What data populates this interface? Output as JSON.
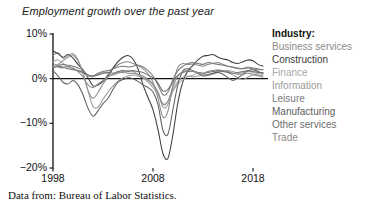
{
  "chart_data": {
    "type": "line",
    "title": "Employment growth over the past year",
    "xlabel": "",
    "ylabel": "",
    "xlim": [
      1998,
      2019.3
    ],
    "ylim": [
      -20,
      10
    ],
    "grid": false,
    "legend_position": "right",
    "legend_title": "Industry:",
    "x_ticks": [
      "1998",
      "2008",
      "2018"
    ],
    "x_tick_values": [
      1998,
      2008,
      2018
    ],
    "y_ticks": [
      "10%",
      "0%",
      "−10%",
      "−20%"
    ],
    "y_tick_values": [
      10,
      0,
      -10,
      -20
    ],
    "zero_line": 0,
    "x": [
      1998.0,
      1998.5,
      1999.0,
      1999.5,
      2000.0,
      2000.5,
      2001.0,
      2001.5,
      2002.0,
      2002.5,
      2003.0,
      2003.5,
      2004.0,
      2004.5,
      2005.0,
      2005.5,
      2006.0,
      2006.5,
      2007.0,
      2007.5,
      2008.0,
      2008.5,
      2009.0,
      2009.5,
      2010.0,
      2010.5,
      2011.0,
      2011.5,
      2012.0,
      2012.5,
      2013.0,
      2013.5,
      2014.0,
      2014.5,
      2015.0,
      2015.5,
      2016.0,
      2016.5,
      2017.0,
      2017.5,
      2018.0,
      2018.5,
      2019.0
    ],
    "series": [
      {
        "name": "Business services",
        "color": "#8c8c8c",
        "values": [
          5.2,
          5.8,
          4.6,
          5.1,
          5.6,
          4.2,
          1.2,
          -2.6,
          -4.4,
          -3.1,
          -1.2,
          0.4,
          2.2,
          3.1,
          3.6,
          3.8,
          3.4,
          3.0,
          2.2,
          1.1,
          -0.8,
          -4.4,
          -8.6,
          -7.2,
          -1.2,
          2.6,
          3.4,
          3.2,
          3.3,
          3.0,
          2.8,
          3.2,
          3.4,
          3.6,
          3.2,
          2.8,
          2.5,
          2.2,
          2.3,
          2.6,
          2.4,
          2.2,
          2.0
        ]
      },
      {
        "name": "Construction",
        "color": "#3c3c3c",
        "values": [
          6.2,
          5.6,
          4.8,
          5.4,
          4.6,
          3.2,
          2.0,
          0.2,
          -1.6,
          -1.4,
          -0.6,
          0.8,
          2.4,
          3.8,
          4.8,
          5.2,
          4.4,
          2.2,
          -1.4,
          -4.2,
          -7.0,
          -11.4,
          -16.8,
          -17.8,
          -12.4,
          -5.2,
          -0.6,
          1.8,
          3.0,
          4.2,
          5.0,
          5.2,
          5.4,
          4.8,
          4.4,
          4.2,
          3.6,
          3.4,
          3.8,
          4.2,
          4.0,
          3.2,
          2.8
        ]
      },
      {
        "name": "Finance",
        "color": "#a8a8a8",
        "values": [
          3.8,
          4.2,
          3.4,
          2.6,
          2.2,
          1.8,
          1.2,
          0.6,
          0.4,
          1.0,
          1.4,
          1.2,
          0.8,
          1.2,
          1.6,
          1.8,
          1.6,
          1.0,
          0.2,
          -0.8,
          -2.0,
          -3.6,
          -5.6,
          -5.2,
          -2.8,
          -1.2,
          -0.2,
          0.4,
          0.8,
          1.2,
          1.0,
          0.8,
          1.0,
          1.4,
          1.6,
          1.8,
          1.6,
          1.2,
          1.4,
          1.6,
          1.4,
          1.2,
          1.2
        ]
      },
      {
        "name": "Information",
        "color": "#9a9a9a",
        "values": [
          2.6,
          3.2,
          4.0,
          4.8,
          5.2,
          4.0,
          1.4,
          -2.8,
          -6.2,
          -6.4,
          -4.6,
          -3.0,
          -1.6,
          -0.6,
          0.2,
          0.6,
          0.8,
          0.6,
          0.2,
          -0.4,
          -1.4,
          -3.2,
          -6.4,
          -5.8,
          -2.6,
          -0.6,
          0.4,
          0.6,
          0.4,
          0.6,
          0.8,
          1.0,
          1.2,
          1.6,
          1.8,
          1.4,
          0.8,
          0.2,
          -0.2,
          0.4,
          0.8,
          0.6,
          0.4
        ]
      },
      {
        "name": "Leisure",
        "color": "#7a7a7a",
        "values": [
          3.4,
          3.0,
          3.2,
          3.0,
          2.8,
          2.4,
          1.8,
          0.8,
          0.6,
          1.2,
          1.6,
          1.8,
          2.2,
          2.6,
          2.8,
          2.6,
          2.8,
          3.0,
          2.6,
          1.8,
          0.6,
          -1.4,
          -3.6,
          -3.0,
          -0.2,
          1.8,
          2.8,
          3.4,
          3.6,
          3.4,
          3.2,
          3.6,
          3.4,
          3.2,
          3.0,
          2.8,
          2.6,
          2.4,
          2.2,
          2.4,
          2.2,
          2.0,
          2.0
        ]
      },
      {
        "name": "Manufacturing",
        "color": "#606060",
        "values": [
          1.8,
          0.6,
          -0.8,
          -1.2,
          -0.4,
          -1.4,
          -3.6,
          -6.6,
          -8.4,
          -7.2,
          -5.6,
          -4.4,
          -2.4,
          -0.8,
          -0.2,
          0.2,
          0.0,
          -0.6,
          -1.4,
          -2.0,
          -3.0,
          -5.8,
          -11.6,
          -12.4,
          -6.8,
          -1.2,
          1.8,
          2.2,
          1.8,
          1.2,
          0.6,
          0.8,
          1.2,
          1.4,
          1.0,
          0.2,
          -0.4,
          0.2,
          1.0,
          1.8,
          2.0,
          1.6,
          1.2
        ]
      },
      {
        "name": "Other services",
        "color": "#6e6e6e",
        "values": [
          2.4,
          2.8,
          2.6,
          2.2,
          2.0,
          1.8,
          1.4,
          0.8,
          0.6,
          0.8,
          1.2,
          1.4,
          1.2,
          1.6,
          1.8,
          1.6,
          1.8,
          1.6,
          1.4,
          0.8,
          0.2,
          -1.0,
          -2.8,
          -2.4,
          -0.6,
          0.8,
          1.4,
          1.6,
          1.6,
          1.4,
          1.2,
          1.4,
          1.6,
          1.8,
          1.6,
          1.4,
          1.2,
          1.4,
          1.6,
          1.8,
          1.6,
          1.4,
          1.4
        ]
      },
      {
        "name": "Trade",
        "color": "#888888",
        "values": [
          2.8,
          2.6,
          2.4,
          2.8,
          2.4,
          1.6,
          0.4,
          -1.4,
          -2.0,
          -1.2,
          -0.4,
          0.4,
          1.0,
          1.4,
          1.4,
          1.2,
          1.2,
          1.0,
          0.6,
          -0.2,
          -1.2,
          -3.0,
          -5.8,
          -5.0,
          -1.8,
          0.6,
          1.6,
          1.8,
          1.6,
          1.4,
          1.2,
          1.6,
          1.8,
          2.0,
          1.8,
          1.6,
          1.2,
          1.0,
          1.0,
          1.2,
          1.0,
          0.8,
          0.8
        ]
      }
    ]
  },
  "legend": {
    "title": "Industry:",
    "items": [
      {
        "label": "Business services",
        "color": "#8c8c8c"
      },
      {
        "label": "Construction",
        "color": "#3c3c3c"
      },
      {
        "label": "Finance",
        "color": "#a8a8a8"
      },
      {
        "label": "Information",
        "color": "#9a9a9a"
      },
      {
        "label": "Leisure",
        "color": "#7a7a7a"
      },
      {
        "label": "Manufacturing",
        "color": "#606060"
      },
      {
        "label": "Other services",
        "color": "#6e6e6e"
      },
      {
        "label": "Trade",
        "color": "#888888"
      }
    ]
  },
  "caption": "Data from: Bureau of Labor Statistics."
}
